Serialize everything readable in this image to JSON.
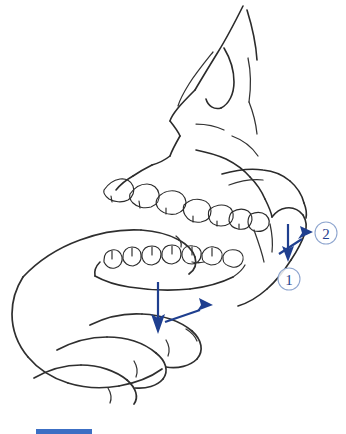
{
  "figure": {
    "background_color": "#ffffff",
    "line_color": "#2b2b2b",
    "accent_color": "#1f3f8f",
    "callout_ring_color": "#8fa6cf"
  },
  "annotations": {
    "callouts": [
      {
        "id": "callout-1",
        "label": "①",
        "number": "1",
        "cx": 289,
        "cy": 279,
        "r": 11
      },
      {
        "id": "callout-2",
        "label": "②",
        "number": "2",
        "cx": 326,
        "cy": 233,
        "r": 11
      }
    ],
    "arrows": [
      {
        "id": "arrow-condyle-down",
        "direction": "down",
        "color": "#1f3f8f",
        "x1": 288,
        "y1": 224,
        "x2": 288,
        "y2": 258
      },
      {
        "id": "arrow-condyle-upright",
        "direction": "up-right",
        "color": "#1f3f8f",
        "x1": 281,
        "y1": 252,
        "x2": 311,
        "y2": 232
      },
      {
        "id": "arrow-chin-down",
        "direction": "down",
        "color": "#1f3f8f",
        "x1": 158,
        "y1": 282,
        "x2": 158,
        "y2": 330
      },
      {
        "id": "arrow-chin-upright",
        "direction": "up-right",
        "color": "#1f3f8f",
        "x1": 166,
        "y1": 322,
        "x2": 211,
        "y2": 306
      }
    ]
  },
  "caption": {
    "bar_color": "#3c6fc4",
    "text": ""
  }
}
